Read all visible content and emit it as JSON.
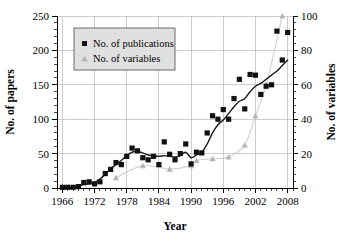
{
  "chart_data": {
    "type": "scatter",
    "title": "",
    "xlabel": "Year",
    "ylabel": "No. of papers",
    "y2label": "No. of variables",
    "xlim": [
      1965,
      2009
    ],
    "ylim": [
      0,
      250
    ],
    "y2lim": [
      0,
      100
    ],
    "grid": true,
    "legend_position": "top-left",
    "x_ticks": [
      1966,
      1972,
      1978,
      1984,
      1990,
      1996,
      2002,
      2008
    ],
    "x_tick_labels": [
      "1966",
      "1972",
      "1978",
      "1984",
      "1990",
      "1996",
      "2002",
      "2008"
    ],
    "x_minor_tick_step": 1,
    "y_ticks": [
      0,
      50,
      100,
      150,
      200,
      250
    ],
    "y_tick_labels": [
      "0",
      "50",
      "100",
      "150",
      "200",
      "250"
    ],
    "y2_ticks": [
      0,
      20,
      40,
      60,
      80,
      100
    ],
    "y2_tick_labels": [
      "0",
      "20",
      "40",
      "60",
      "80",
      "100"
    ],
    "series": [
      {
        "name": "No. of publications",
        "marker": "square",
        "color": "#111111",
        "axis": "left",
        "x": [
          1966,
          1967,
          1968,
          1969,
          1970,
          1971,
          1972,
          1973,
          1974,
          1975,
          1976,
          1977,
          1978,
          1979,
          1980,
          1981,
          1982,
          1983,
          1984,
          1985,
          1986,
          1987,
          1988,
          1989,
          1990,
          1991,
          1992,
          1993,
          1994,
          1995,
          1996,
          1997,
          1998,
          1999,
          2000,
          2001,
          2002,
          2003,
          2004,
          2005,
          2006,
          2007,
          2008
        ],
        "values": [
          1,
          1,
          1,
          2,
          8,
          9,
          6,
          9,
          21,
          27,
          37,
          34,
          46,
          58,
          54,
          44,
          41,
          46,
          34,
          67,
          49,
          41,
          50,
          64,
          35,
          52,
          51,
          80,
          105,
          100,
          114,
          100,
          130,
          158,
          115,
          165,
          164,
          136,
          148,
          150,
          228,
          186,
          226
        ]
      },
      {
        "name": "No. of variables",
        "marker": "triangle",
        "color": "#b5b5b5",
        "axis": "right",
        "x": [
          1976,
          1981,
          1986,
          1990,
          1991,
          1994,
          1997,
          2000,
          2002,
          2004,
          2007
        ],
        "values": [
          6,
          13,
          11,
          13,
          16,
          17,
          18,
          25,
          42,
          60,
          100
        ]
      }
    ],
    "trend_lines": [
      {
        "name": "publications-trend",
        "axis": "left",
        "color": "#1a1a1a",
        "x": [
          1966,
          1967,
          1968,
          1969,
          1970,
          1971,
          1972,
          1973,
          1974,
          1975,
          1976,
          1977,
          1978,
          1979,
          1980,
          1981,
          1982,
          1983,
          1984,
          1985,
          1986,
          1987,
          1988,
          1989,
          1990,
          1991,
          1992,
          1993,
          1994,
          1995,
          1996,
          1997,
          1998,
          1999,
          2000,
          2001,
          2002,
          2003,
          2004,
          2005,
          2006,
          2007,
          2008
        ],
        "values": [
          1,
          1,
          1,
          3,
          5,
          6,
          8,
          13,
          20,
          28,
          34,
          40,
          47,
          52,
          53,
          51,
          48,
          47,
          46,
          47,
          46,
          45,
          47,
          52,
          44,
          48,
          52,
          64,
          80,
          92,
          99,
          108,
          118,
          126,
          130,
          140,
          148,
          152,
          158,
          164,
          170,
          178,
          186
        ]
      },
      {
        "name": "variables-trend",
        "axis": "right",
        "color": "#cfcfcf",
        "x": [
          1976,
          1981,
          1986,
          1990,
          1991,
          1994,
          1997,
          2000,
          2002,
          2004,
          2007
        ],
        "values": [
          6,
          13,
          11,
          13,
          16,
          17,
          18,
          25,
          42,
          60,
          100
        ]
      }
    ]
  },
  "legend": {
    "entries": [
      {
        "label": "No. of publications",
        "marker": "square"
      },
      {
        "label": "No. of variables",
        "marker": "triangle"
      }
    ]
  }
}
